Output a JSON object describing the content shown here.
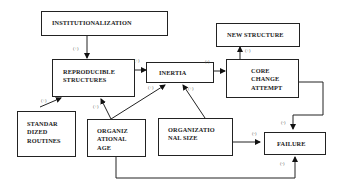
{
  "diagram": {
    "nodes": {
      "institutionalization": {
        "label": "INSTITUTIONALIZATION"
      },
      "reproducible_structures": {
        "line1": "REPRODUCIBLE",
        "line2": "STRUCTURES"
      },
      "inertia": {
        "label": "INERTIA"
      },
      "new_structure": {
        "label": "NEW STRUCTURE"
      },
      "core_change_attempt": {
        "line1": "CORE",
        "line2": "CHANGE",
        "line3": "ATTEMPT"
      },
      "standardized_routines": {
        "line1": "STANDAR",
        "line2": "DIZED",
        "line3": "ROUTINES"
      },
      "organizational_age": {
        "line1": "ORGANIZ",
        "line2": "ATIONAL",
        "line3": "AGE"
      },
      "organizational_size": {
        "line1": "ORGANIZATIO",
        "line2": "NAL SIZE"
      },
      "failure": {
        "label": "FAILURE"
      }
    },
    "edges": [
      {
        "from": "INSTITUTIONALIZATION",
        "to": "REPRODUCIBLE STRUCTURES",
        "sign": "(+)"
      },
      {
        "from": "STANDARDIZED ROUTINES",
        "to": "REPRODUCIBLE STRUCTURES",
        "sign": "(+)"
      },
      {
        "from": "ORGANIZATIONAL AGE",
        "to": "REPRODUCIBLE STRUCTURES",
        "sign": "(+)"
      },
      {
        "from": "REPRODUCIBLE STRUCTURES",
        "to": "INERTIA",
        "sign": "(+)"
      },
      {
        "from": "ORGANIZATIONAL AGE",
        "to": "INERTIA",
        "sign": "(+)"
      },
      {
        "from": "ORGANIZATIONAL SIZE",
        "to": "INERTIA",
        "sign": "(+)"
      },
      {
        "from": "INERTIA",
        "to": "CORE CHANGE ATTEMPT",
        "sign": "(-)"
      },
      {
        "from": "CORE CHANGE ATTEMPT",
        "to": "NEW STRUCTURE",
        "sign": "(+)"
      },
      {
        "from": "CORE CHANGE ATTEMPT",
        "to": "FAILURE",
        "sign": "(-)"
      },
      {
        "from": "ORGANIZATIONAL SIZE",
        "to": "FAILURE",
        "sign": "(-)"
      },
      {
        "from": "ORGANIZATIONAL AGE",
        "to": "FAILURE",
        "sign": "(-)"
      }
    ],
    "labels": {
      "inst_to_rep": "(+)",
      "std_to_rep": "(+)",
      "age_to_rep": "(+)",
      "rep_to_inertia": "(+)",
      "age_to_inertia": "(+)",
      "size_to_inertia": "(+)",
      "inertia_to_core": "(-)",
      "core_to_new": "(+)",
      "core_to_failure": "(-)",
      "size_to_failure": "(-)",
      "age_to_failure": "(-)"
    }
  }
}
